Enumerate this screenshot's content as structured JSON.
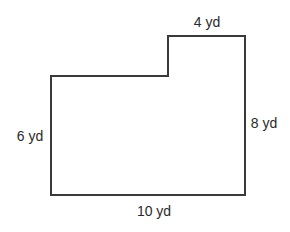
{
  "diagram": {
    "type": "L-shaped composite rectangle",
    "stroke_color": "#3a3a3a",
    "labels": {
      "top": "4 yd",
      "left": "6 yd",
      "right": "8 yd",
      "bottom": "10 yd"
    }
  }
}
